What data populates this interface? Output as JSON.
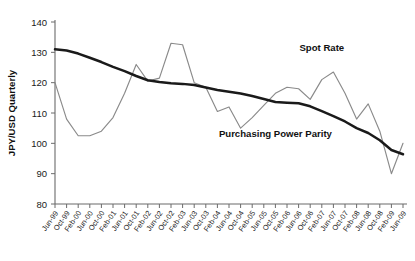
{
  "chart_data": {
    "type": "line",
    "title": "",
    "xlabel": "",
    "ylabel": "JPY/USD Quarterly",
    "ylim": [
      80,
      140
    ],
    "yticks": [
      80,
      90,
      100,
      110,
      120,
      130,
      140
    ],
    "grid": false,
    "legend_position": "inline-annotations",
    "categories": [
      "Jun-99",
      "Oct-99",
      "Feb-00",
      "Jun-00",
      "Oct-00",
      "Feb-01",
      "Jun-01",
      "Oct-01",
      "Feb-02",
      "Jun-02",
      "Oct-02",
      "Feb-03",
      "Jun-03",
      "Oct-03",
      "Feb-04",
      "Jun-04",
      "Oct-04",
      "Feb-05",
      "Jun-05",
      "Oct-05",
      "Feb-06",
      "Jun-06",
      "Oct-06",
      "Feb-07",
      "Jun-07",
      "Oct-07",
      "Feb-08",
      "Jun-08",
      "Oct-08",
      "Feb-09",
      "Jun-09"
    ],
    "series": [
      {
        "name": "Spot Rate",
        "color": "#8a8a8a",
        "values": [
          120.0,
          108.0,
          102.5,
          102.5,
          104.0,
          108.5,
          116.5,
          126.0,
          120.5,
          121.5,
          133.0,
          132.5,
          120.0,
          118.5,
          110.5,
          112.0,
          105.0,
          108.5,
          112.5,
          116.5,
          118.5,
          118.0,
          114.5,
          121.0,
          123.5,
          116.5,
          108.0,
          113.0,
          104.0,
          90.0,
          100.0
        ]
      },
      {
        "name": "Purchasing Power Parity",
        "color": "#1a1a1a",
        "values": [
          131.0,
          130.6,
          129.6,
          128.2,
          126.8,
          125.2,
          123.8,
          122.2,
          120.8,
          120.2,
          119.8,
          119.6,
          119.2,
          118.4,
          117.6,
          117.0,
          116.4,
          115.6,
          114.6,
          113.6,
          113.4,
          113.2,
          112.2,
          110.6,
          109.0,
          107.2,
          105.0,
          103.4,
          101.0,
          97.8,
          96.4
        ]
      }
    ],
    "annotations": [
      {
        "text": "Spot Rate",
        "x_category": "Feb-07",
        "y_value": 130.5
      },
      {
        "text": "Purchasing Power Parity",
        "x_category": "Oct-05",
        "y_value": 102.0
      }
    ]
  }
}
